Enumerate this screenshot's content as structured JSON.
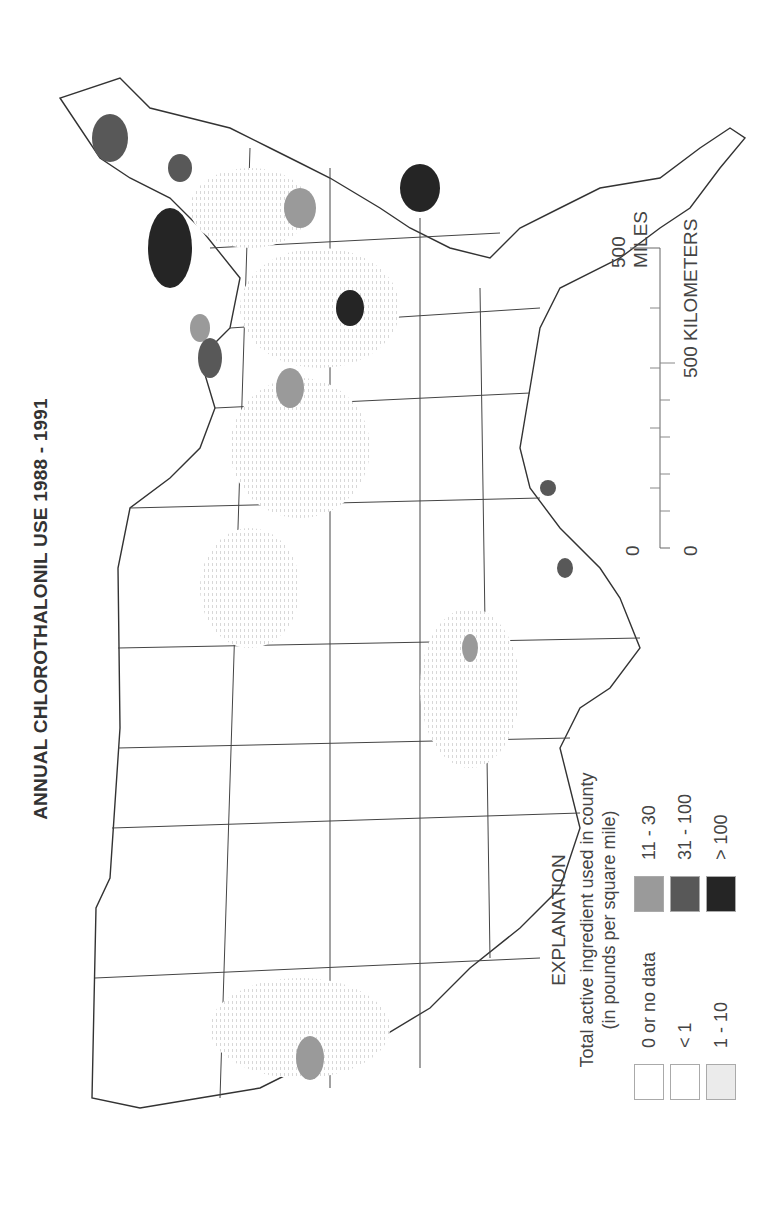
{
  "title": "ANNUAL CHLOROTHALONIL  USE 1988 - 1991",
  "legend": {
    "heading": "EXPLANATION",
    "subtitle_line1": "Total active ingredient used in county",
    "subtitle_line2": "(in pounds per square mile)",
    "items": [
      {
        "label": "0 or no data",
        "color": "#ffffff"
      },
      {
        "label": "< 1",
        "color": "#ffffff"
      },
      {
        "label": "1 - 10",
        "color": "#ebebeb"
      },
      {
        "label": "11 - 30",
        "color": "#9a9a9a"
      },
      {
        "label": "31 - 100",
        "color": "#585858"
      },
      {
        "label": "> 100",
        "color": "#252525"
      }
    ]
  },
  "scale_bar": {
    "miles_zero": "0",
    "miles_label": "500 MILES",
    "km_zero": "0",
    "km_label": "500 KILOMETERS"
  },
  "map": {
    "region": "Conterminous United States",
    "orientation": "rotated 90 degrees counter-clockwise",
    "hotspots": [
      {
        "area": "Florida",
        "class": "31 - 100 / > 100"
      },
      {
        "area": "Georgia / Carolinas coastal plain",
        "class": "> 100"
      },
      {
        "area": "Delmarva / New Jersey",
        "class": "> 100"
      },
      {
        "area": "Long Island / Connecticut",
        "class": "31 - 100"
      },
      {
        "area": "Western Michigan / Lake Michigan shore",
        "class": "31 - 100"
      },
      {
        "area": "Southern Texas",
        "class": "31 - 100"
      },
      {
        "area": "Central Valley California",
        "class": "11 - 30"
      }
    ]
  }
}
